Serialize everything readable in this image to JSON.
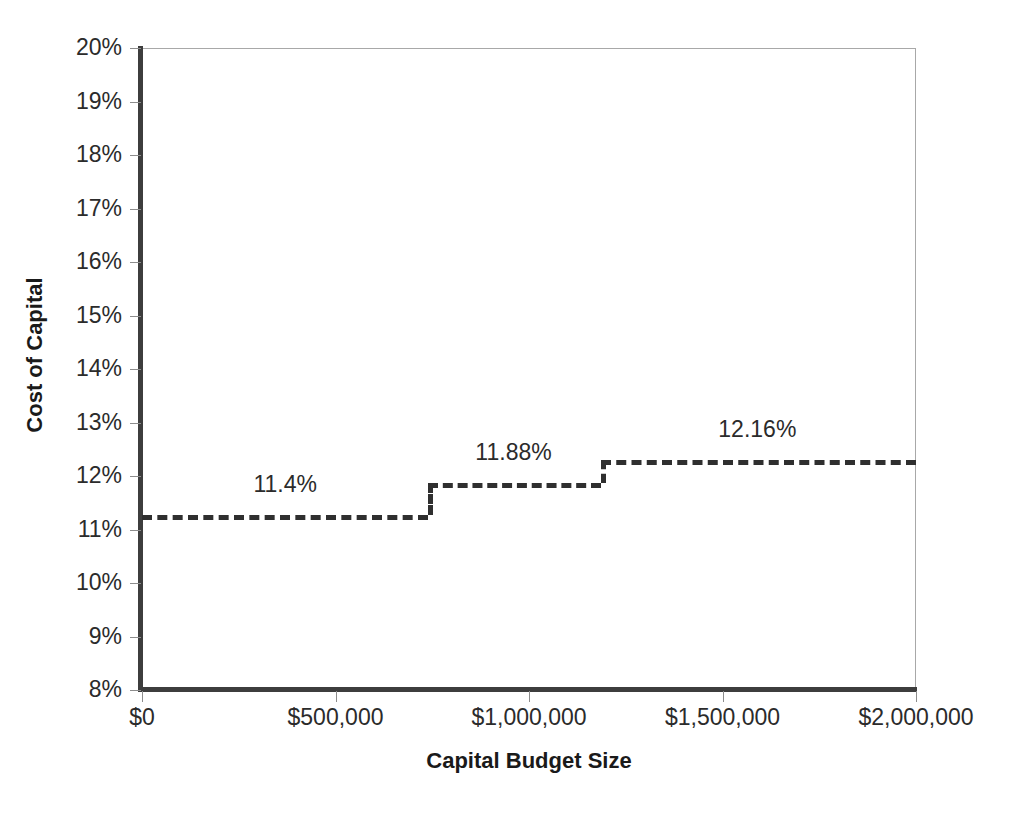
{
  "chart_data": {
    "type": "line",
    "subtype": "step",
    "title": "",
    "xlabel": "Capital Budget Size",
    "ylabel": "Cost of Capital",
    "xlim": [
      0,
      2000000
    ],
    "ylim": [
      0.08,
      0.2
    ],
    "grid": false,
    "legend": false,
    "x_tick_labels": [
      "$0",
      "$500,000",
      "$1,000,000",
      "$1,500,000",
      "$2,000,000"
    ],
    "x_tick_values": [
      0,
      500000,
      1000000,
      1500000,
      2000000
    ],
    "y_tick_labels": [
      "8%",
      "9%",
      "10%",
      "11%",
      "12%",
      "13%",
      "14%",
      "15%",
      "16%",
      "17%",
      "18%",
      "19%",
      "20%"
    ],
    "y_tick_values": [
      8,
      9,
      10,
      11,
      12,
      13,
      14,
      15,
      16,
      17,
      18,
      19,
      20
    ],
    "series": [
      {
        "name": "Marginal Cost of Capital",
        "style": "dashed-step",
        "color": "#2f2f2f",
        "steps": [
          {
            "x_start": 0,
            "x_end": 740000,
            "value": 11.27,
            "label": "11.4%",
            "label_x": 370000
          },
          {
            "x_start": 740000,
            "x_end": 1185000,
            "value": 11.87,
            "label": "11.88%",
            "label_x": 960000
          },
          {
            "x_start": 1185000,
            "x_end": 2000000,
            "value": 12.3,
            "label": "12.16%",
            "label_x": 1590000
          }
        ]
      }
    ],
    "annotations": [
      "11.4%",
      "11.88%",
      "12.16%"
    ]
  }
}
